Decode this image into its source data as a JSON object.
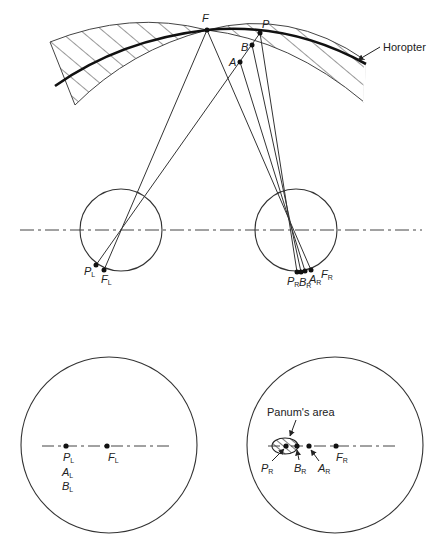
{
  "figure": {
    "top": {
      "horopter_label": "Horopter",
      "points": {
        "F": "F",
        "P": "P",
        "B": "B",
        "A": "A"
      },
      "left_eye": {
        "P": {
          "main": "P",
          "sub": "L"
        },
        "F": {
          "main": "F",
          "sub": "L"
        }
      },
      "right_eye": {
        "P": {
          "main": "P",
          "sub": "R"
        },
        "B": {
          "main": "B",
          "sub": "R"
        },
        "A": {
          "main": "A",
          "sub": "R"
        },
        "F": {
          "main": "F",
          "sub": "R"
        }
      }
    },
    "bottom_left": {
      "P": {
        "main": "P",
        "sub": "L"
      },
      "F": {
        "main": "F",
        "sub": "L"
      },
      "A": {
        "main": "A",
        "sub": "L"
      },
      "B": {
        "main": "B",
        "sub": "L"
      }
    },
    "bottom_right": {
      "panum_label": "Panum's area",
      "P": {
        "main": "P",
        "sub": "R"
      },
      "B": {
        "main": "B",
        "sub": "R"
      },
      "A": {
        "main": "A",
        "sub": "R"
      },
      "F": {
        "main": "F",
        "sub": "R"
      }
    }
  }
}
